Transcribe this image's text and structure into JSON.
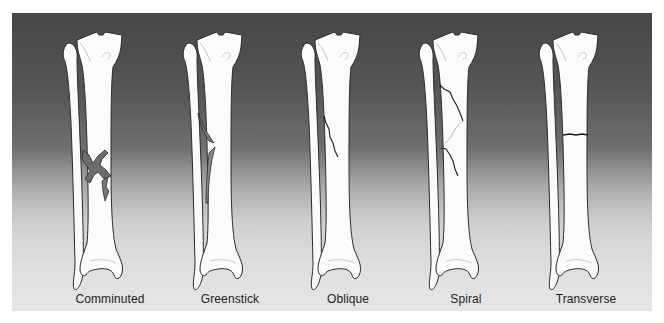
{
  "figure": {
    "background": {
      "top_color": "#474747",
      "bottom_color": "#e6e6e6"
    },
    "bone_fill": "#fbfbfb",
    "outline_color": "#2a2a2a",
    "fracture_color": "#1a1a1a",
    "fractures": [
      {
        "id": "comminuted",
        "label": "Comminuted",
        "x": 38
      },
      {
        "id": "greenstick",
        "label": "Greenstick",
        "x": 158
      },
      {
        "id": "oblique",
        "label": "Oblique",
        "x": 276
      },
      {
        "id": "spiral",
        "label": "Spiral",
        "x": 394
      },
      {
        "id": "transverse",
        "label": "Transverse",
        "x": 514
      }
    ]
  }
}
